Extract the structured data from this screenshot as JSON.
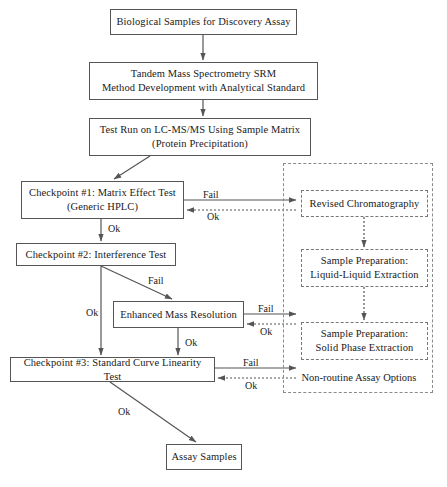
{
  "diagram": {
    "background_color": "#ffffff",
    "line_color": "#555555",
    "text_color": "#1a1a1a"
  },
  "nodes": {
    "biological_samples": "Biological Samples for Discovery Assay",
    "tandem_ms_line1": "Tandem Mass Spectrometry SRM",
    "tandem_ms_line2": "Method Development with Analytical Standard",
    "test_run_line1": "Test Run on LC-MS/MS Using Sample Matrix",
    "test_run_line2": "(Protein Precipitation)",
    "checkpoint1_line1": "Checkpoint #1: Matrix Effect Test",
    "checkpoint1_line2": "(Generic HPLC)",
    "checkpoint2": "Checkpoint #2: Interference Test",
    "enhanced_mass_resolution": "Enhanced Mass Resolution",
    "checkpoint3": "Checkpoint #3: Standard Curve Linearity Test",
    "assay_samples": "Assay Samples",
    "revised_chromatography": "Revised Chromatography",
    "sample_prep_lle_line1": "Sample Preparation:",
    "sample_prep_lle_line2": "Liquid-Liquid Extraction",
    "sample_prep_spe_line1": "Sample Preparation:",
    "sample_prep_spe_line2": "Solid Phase Extraction"
  },
  "group": {
    "caption": "Non-routine Assay Options"
  },
  "edge_labels": {
    "cp1_fail": "Fail",
    "cp1_ok_return": "Ok",
    "cp1_ok_down": "Ok",
    "cp2_fail": "Fail",
    "cp2_ok_down": "Ok",
    "emr_fail": "Fail",
    "emr_ok_return": "Ok",
    "emr_ok_down": "Ok",
    "cp3_fail": "Fail",
    "cp3_ok_return": "Ok",
    "cp3_ok_final": "Ok"
  }
}
